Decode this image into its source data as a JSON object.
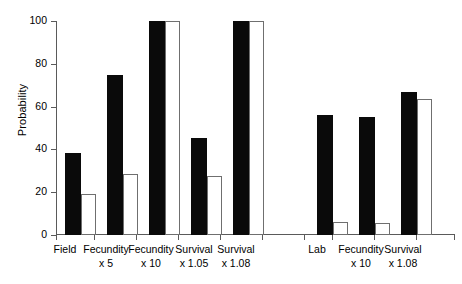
{
  "chart_data": {
    "type": "bar",
    "title": "",
    "xlabel": "",
    "ylabel": "Probability",
    "ylim": [
      0,
      100
    ],
    "yticks": [
      0,
      20,
      40,
      60,
      80,
      100
    ],
    "ytick_labels": [
      "0",
      "20",
      "40",
      "60",
      "80",
      "100"
    ],
    "grid": false,
    "legend": "none",
    "categories": [
      "Field",
      "Fecundity x 5",
      "Fecundity x 10",
      "Survival x 1.05",
      "Survival x 1.08",
      "Lab",
      "Fecundity x 10",
      "Survival x 1.08"
    ],
    "series": [
      {
        "name": "solid",
        "style": "filled-black",
        "values": [
          38.5,
          75.0,
          100.0,
          45.5,
          100.0,
          56.0,
          55.0,
          67.0
        ]
      },
      {
        "name": "open",
        "style": "open-white",
        "values": [
          19.0,
          28.5,
          100.0,
          27.5,
          100.0,
          6.0,
          5.5,
          63.5
        ]
      }
    ],
    "groups": [
      {
        "id": "field-group",
        "labels": [
          "Field",
          ""
        ],
        "solid": 38.5,
        "open": 19.0
      },
      {
        "id": "field-fecundity-x5",
        "labels": [
          "Fecundity",
          "x 5"
        ],
        "solid": 75.0,
        "open": 28.5
      },
      {
        "id": "field-fecundity-x10",
        "labels": [
          "Fecundity",
          "x 10"
        ],
        "solid": 100.0,
        "open": 100.0
      },
      {
        "id": "field-survival-x105",
        "labels": [
          "Survival",
          "x 1.05"
        ],
        "solid": 45.5,
        "open": 27.5
      },
      {
        "id": "field-survival-x108",
        "labels": [
          "Survival",
          "x 1.08"
        ],
        "solid": 100.0,
        "open": 100.0
      },
      {
        "id": "lab-group",
        "labels": [
          "Lab",
          ""
        ],
        "solid": 56.0,
        "open": 6.0
      },
      {
        "id": "lab-fecundity-x10",
        "labels": [
          "Fecundity",
          "x 10"
        ],
        "solid": 55.0,
        "open": 5.5
      },
      {
        "id": "lab-survival-x108",
        "labels": [
          "Survival",
          "x 1.08"
        ],
        "solid": 67.0,
        "open": 63.5
      }
    ]
  },
  "axis": {
    "ylabel": "Probability",
    "tick_0": "0",
    "tick_20": "20",
    "tick_40": "40",
    "tick_60": "60",
    "tick_80": "80",
    "tick_100": "100"
  },
  "labels": {
    "g0_l1": "Field",
    "g0_l2": "",
    "g1_l1": "Fecundity",
    "g1_l2": "x 5",
    "g2_l1": "Fecundity",
    "g2_l2": "x 10",
    "g3_l1": "Survival",
    "g3_l2": "x 1.05",
    "g4_l1": "Survival",
    "g4_l2": "x 1.08",
    "g5_l1": "Lab",
    "g5_l2": "",
    "g6_l1": "Fecundity",
    "g6_l2": "x 10",
    "g7_l1": "Survival",
    "g7_l2": "x 1.08"
  },
  "colors": {
    "solid_bar": "#0a0a0a",
    "open_bar_fill": "#ffffff",
    "open_bar_stroke": "#6f6f6f",
    "axis": "#5a5a5a",
    "background": "#ffffff"
  }
}
